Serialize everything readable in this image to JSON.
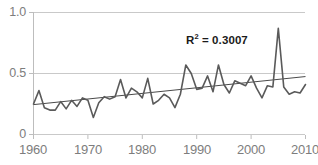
{
  "chart_data": {
    "type": "line",
    "title": "",
    "xlabel": "",
    "ylabel": "",
    "xlim": [
      1960,
      2010
    ],
    "ylim": [
      0,
      1.0
    ],
    "ytick_labels": [
      "1.0",
      "0.5",
      "0"
    ],
    "ytick_values": [
      1.0,
      0.5,
      0
    ],
    "xtick_labels": [
      "1960",
      "1970",
      "1980",
      "1990",
      "2000",
      "2010"
    ],
    "xtick_values": [
      1960,
      1970,
      1980,
      1990,
      2000,
      2010
    ],
    "grid": "horizontal",
    "legend": "none",
    "annotations": [
      {
        "name": "r-squared",
        "prefix": "R",
        "superscript": "2",
        "suffix": " = 0.3007",
        "text": "R² = 0.3007",
        "value": 0.3007
      }
    ],
    "series": [
      {
        "name": "annual-value",
        "type": "line",
        "color": "#5a5a5a",
        "x": [
          1960,
          1961,
          1962,
          1963,
          1964,
          1965,
          1966,
          1967,
          1968,
          1969,
          1970,
          1971,
          1972,
          1973,
          1974,
          1975,
          1976,
          1977,
          1978,
          1979,
          1980,
          1981,
          1982,
          1983,
          1984,
          1985,
          1986,
          1987,
          1988,
          1989,
          1990,
          1991,
          1992,
          1993,
          1994,
          1995,
          1996,
          1997,
          1998,
          1999,
          2000,
          2001,
          2002,
          2003,
          2004,
          2005,
          2006,
          2007,
          2008,
          2009,
          2010
        ],
        "values": [
          0.25,
          0.36,
          0.22,
          0.2,
          0.2,
          0.27,
          0.21,
          0.28,
          0.23,
          0.3,
          0.28,
          0.14,
          0.26,
          0.31,
          0.29,
          0.31,
          0.45,
          0.3,
          0.38,
          0.35,
          0.3,
          0.46,
          0.25,
          0.28,
          0.33,
          0.3,
          0.22,
          0.33,
          0.57,
          0.5,
          0.37,
          0.38,
          0.48,
          0.35,
          0.57,
          0.41,
          0.34,
          0.44,
          0.42,
          0.4,
          0.48,
          0.38,
          0.3,
          0.4,
          0.39,
          0.87,
          0.39,
          0.33,
          0.35,
          0.34,
          0.41
        ]
      },
      {
        "name": "linear-trend",
        "type": "line",
        "color": "#4a4a4a",
        "x": [
          1960,
          2010
        ],
        "values": [
          0.245,
          0.475
        ]
      }
    ]
  },
  "axes": {
    "y_axis_name": "y-axis",
    "x_axis_name": "x-axis"
  }
}
